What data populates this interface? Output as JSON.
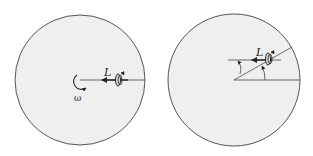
{
  "figure": {
    "panels": [
      {
        "id": "left",
        "description": "Rotating disk with gyroscope at rim, angular momentum pointing toward center",
        "labels": {
          "angular_momentum": "L",
          "angular_velocity": "ω"
        }
      },
      {
        "id": "right",
        "description": "Disk rotated; gyroscope angular momentum stays fixed while radial line turns by an angle",
        "labels": {
          "angular_momentum": "L"
        }
      }
    ],
    "colors": {
      "disk_fill": "#efefef",
      "stroke": "#555555",
      "ink": "#222222"
    }
  }
}
